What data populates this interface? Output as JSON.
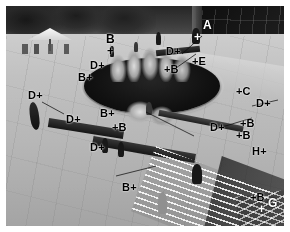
{
  "image": {
    "title": "Annotated plaza surveillance photograph",
    "type": "grayscale-photo-with-overlay",
    "width": 290,
    "height": 232,
    "border_color": "#ffffff",
    "palette": {
      "paving_light": "#c9c9c9",
      "paving_mid": "#b4b4b4",
      "paving_dark": "#a2a2a2",
      "basin_dark": "#171717",
      "building_dark": "#1e1e1e",
      "annotation_black": "#000000",
      "annotation_white": "#ffffff"
    }
  },
  "scene": {
    "description": "Elevated oblique view of a paved public plaza with a dark oval fountain basin and rock sculpture at centre, a white umbrella canopy and trees upper left, a dark glazed building facade upper right, long dark benches crossing the paving, pedestrians, and a white handrail with steps at lower right.",
    "regions": [
      {
        "name": "tree-band",
        "label": "trees"
      },
      {
        "name": "umbrella-canopy",
        "label": "umbrella"
      },
      {
        "name": "building-facade",
        "label": "building"
      },
      {
        "name": "fountain-basin",
        "label": "basin"
      },
      {
        "name": "rock-sculpture",
        "label": "rocks"
      },
      {
        "name": "plaza-paving",
        "label": "paving"
      },
      {
        "name": "handrail",
        "label": "railing"
      },
      {
        "name": "steps",
        "label": "steps"
      }
    ],
    "people": [
      {
        "id": "p1",
        "x": 104,
        "y": 40,
        "w": 4,
        "h": 11,
        "tone": "dark"
      },
      {
        "id": "p2",
        "x": 128,
        "y": 36,
        "w": 4,
        "h": 10,
        "tone": "light"
      },
      {
        "id": "p3",
        "x": 150,
        "y": 26,
        "w": 5,
        "h": 13,
        "tone": "dark"
      },
      {
        "id": "p4",
        "x": 186,
        "y": 22,
        "w": 8,
        "h": 16,
        "tone": "dark"
      },
      {
        "id": "p5",
        "x": 140,
        "y": 96,
        "w": 6,
        "h": 13,
        "tone": "light"
      },
      {
        "id": "p6",
        "x": 96,
        "y": 132,
        "w": 6,
        "h": 15,
        "tone": "dark"
      },
      {
        "id": "p7",
        "x": 112,
        "y": 136,
        "w": 6,
        "h": 15,
        "tone": "dark"
      },
      {
        "id": "p8",
        "x": 186,
        "y": 158,
        "w": 10,
        "h": 20,
        "tone": "dark"
      },
      {
        "id": "p9",
        "x": 152,
        "y": 186,
        "w": 9,
        "h": 22,
        "tone": "pale"
      }
    ]
  },
  "annotations": {
    "legend_classes": [
      "A",
      "B",
      "C",
      "D",
      "E",
      "G",
      "H"
    ],
    "marker_glyph": "+",
    "markers": [
      {
        "id": "m01",
        "label": "A",
        "text": "A",
        "order": "label-above",
        "x": 197,
        "y": 14,
        "color": "white"
      },
      {
        "id": "m02",
        "label": "A",
        "text": "+",
        "order": "cross",
        "x": 188,
        "y": 26,
        "color": "white"
      },
      {
        "id": "m03",
        "label": "B",
        "text": "B",
        "order": "label",
        "x": 100,
        "y": 28,
        "color": "black"
      },
      {
        "id": "m04",
        "label": "B",
        "text": "+",
        "order": "cross",
        "x": 101,
        "y": 40,
        "color": "black"
      },
      {
        "id": "m05",
        "label": "D",
        "text": "D+",
        "order": "label-left",
        "x": 160,
        "y": 40,
        "color": "black"
      },
      {
        "id": "m06",
        "label": "E",
        "text": "+E",
        "order": "label-right",
        "x": 186,
        "y": 50,
        "color": "black"
      },
      {
        "id": "m07",
        "label": "B",
        "text": "+B",
        "order": "label-right",
        "x": 158,
        "y": 58,
        "color": "black"
      },
      {
        "id": "m08",
        "label": "D",
        "text": "D+",
        "order": "label-left",
        "x": 84,
        "y": 54,
        "color": "black"
      },
      {
        "id": "m09",
        "label": "B",
        "text": "B+",
        "order": "label-left",
        "x": 72,
        "y": 66,
        "color": "black"
      },
      {
        "id": "m10",
        "label": "D",
        "text": "D+",
        "order": "label-left",
        "x": 22,
        "y": 84,
        "color": "black"
      },
      {
        "id": "m11",
        "label": "C",
        "text": "+C",
        "order": "label-right",
        "x": 230,
        "y": 80,
        "color": "black"
      },
      {
        "id": "m12",
        "label": "D",
        "text": "D+",
        "order": "label-left",
        "x": 250,
        "y": 92,
        "color": "black"
      },
      {
        "id": "m13",
        "label": "B",
        "text": "B+",
        "order": "label-left",
        "x": 94,
        "y": 102,
        "color": "black"
      },
      {
        "id": "m14",
        "label": "D",
        "text": "D+",
        "order": "label-left",
        "x": 60,
        "y": 108,
        "color": "black"
      },
      {
        "id": "m15",
        "label": "B",
        "text": "+B",
        "order": "label-right",
        "x": 106,
        "y": 116,
        "color": "black"
      },
      {
        "id": "m16",
        "label": "B",
        "text": "+B",
        "order": "label-right",
        "x": 234,
        "y": 112,
        "color": "black"
      },
      {
        "id": "m17",
        "label": "D",
        "text": "D+",
        "order": "label-left",
        "x": 204,
        "y": 116,
        "color": "black"
      },
      {
        "id": "m18",
        "label": "B",
        "text": "+B",
        "order": "label-right",
        "x": 230,
        "y": 124,
        "color": "black"
      },
      {
        "id": "m19",
        "label": "D",
        "text": "D+",
        "order": "label-left",
        "x": 84,
        "y": 136,
        "color": "black"
      },
      {
        "id": "m20",
        "label": "H",
        "text": "H+",
        "order": "label-left",
        "x": 246,
        "y": 140,
        "color": "black"
      },
      {
        "id": "m21",
        "label": "B",
        "text": "B+",
        "order": "label-left",
        "x": 116,
        "y": 176,
        "color": "black"
      },
      {
        "id": "m22",
        "label": "B",
        "text": "+B",
        "order": "label-right",
        "x": 244,
        "y": 186,
        "color": "black"
      },
      {
        "id": "m23",
        "label": "G",
        "text": "G",
        "order": "label",
        "x": 262,
        "y": 192,
        "color": "white"
      },
      {
        "id": "m24",
        "label": "G",
        "text": "+",
        "order": "cross",
        "x": 252,
        "y": 198,
        "color": "white"
      }
    ],
    "leader_lines": [
      {
        "id": "l1",
        "x1": 176,
        "y1": 48,
        "x2": 196,
        "y2": 30
      },
      {
        "id": "l2",
        "x1": 170,
        "y1": 62,
        "x2": 190,
        "y2": 48
      },
      {
        "id": "l3",
        "x1": 206,
        "y1": 124,
        "x2": 246,
        "y2": 112
      },
      {
        "id": "l4",
        "x1": 246,
        "y1": 100,
        "x2": 272,
        "y2": 94
      },
      {
        "id": "l5",
        "x1": 36,
        "y1": 96,
        "x2": 58,
        "y2": 108
      },
      {
        "id": "l6",
        "x1": 140,
        "y1": 106,
        "x2": 188,
        "y2": 130
      },
      {
        "id": "l7",
        "x1": 110,
        "y1": 170,
        "x2": 150,
        "y2": 160
      }
    ]
  }
}
